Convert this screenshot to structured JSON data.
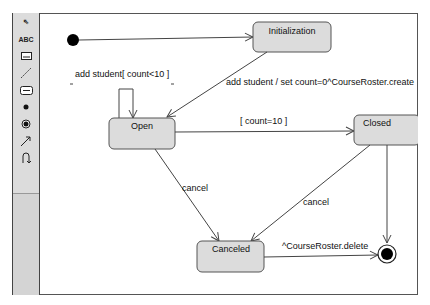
{
  "palette": {
    "tools": [
      {
        "name": "select-arrow-icon",
        "glyph": "⇖"
      },
      {
        "name": "text-tool-icon",
        "glyph": "ABC"
      },
      {
        "name": "note-tool-icon",
        "glyph": "▭"
      },
      {
        "name": "anchor-line-tool-icon",
        "glyph": "⋰"
      },
      {
        "name": "state-tool-icon",
        "glyph": "▭"
      },
      {
        "name": "initial-state-tool-icon",
        "glyph": "●"
      },
      {
        "name": "final-state-tool-icon",
        "glyph": "◉"
      },
      {
        "name": "transition-tool-icon",
        "glyph": "↗"
      },
      {
        "name": "self-transition-tool-icon",
        "glyph": "∩"
      }
    ]
  },
  "diagram": {
    "states": {
      "initialization": "Initialization",
      "open": "Open",
      "closed": "Closed",
      "canceled": "Canceled"
    },
    "transitions": {
      "self_loop": "add student[ count<10 ]",
      "init_to_open": "add student / set count=0^CourseRoster.create",
      "open_to_closed": "[ count=10 ]",
      "open_to_canceled": "cancel",
      "closed_to_canceled": "cancel",
      "canceled_to_final": "^CourseRoster.delete"
    },
    "colors": {
      "state_fill": "#dcdcdc",
      "state_border": "#555555",
      "line": "#444444"
    }
  }
}
